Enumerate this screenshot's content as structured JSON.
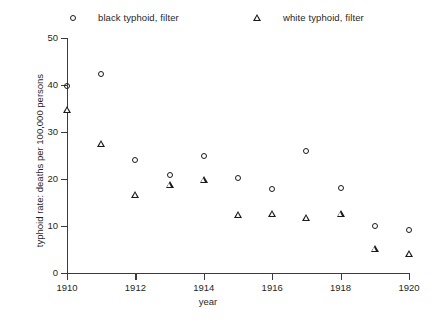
{
  "chart_data": {
    "type": "scatter",
    "title": "",
    "xlabel": "year",
    "ylabel": "typhoid rate: deaths per 100,000 persons",
    "x": [
      1910,
      1911,
      1912,
      1913,
      1914,
      1915,
      1916,
      1917,
      1918,
      1919,
      1920
    ],
    "xlim": [
      1909.5,
      1920.5
    ],
    "ylim": [
      0,
      52
    ],
    "xticks": [
      1910,
      1912,
      1914,
      1916,
      1918,
      1920
    ],
    "xtick_labels": [
      "1910",
      "1912",
      "1914",
      "1916",
      "1918",
      "1920"
    ],
    "yticks": [
      0,
      10,
      20,
      30,
      40,
      50
    ],
    "ytick_labels": [
      "0",
      "10",
      "20",
      "30",
      "40",
      "50"
    ],
    "grid": false,
    "legend_position": "top",
    "series": [
      {
        "name": "black typhoid, filter",
        "marker": "circle",
        "color": "#1a1a1a",
        "values": [
          41.5,
          44.0,
          25.7,
          22.6,
          26.5,
          21.9,
          19.6,
          27.7,
          19.8,
          11.8,
          10.9
        ]
      },
      {
        "name": "white typhoid, filter",
        "marker": "triangle",
        "color": "#1a1a1a",
        "values": [
          36.2,
          29.0,
          18.1,
          20.2,
          21.3,
          13.8,
          14.0,
          13.2,
          14.0,
          6.6,
          5.5
        ]
      }
    ]
  },
  "legend": {
    "entries": [
      {
        "label": "black typhoid, filter",
        "marker": "circle"
      },
      {
        "label": "white typhoid, filter",
        "marker": "triangle"
      }
    ]
  }
}
